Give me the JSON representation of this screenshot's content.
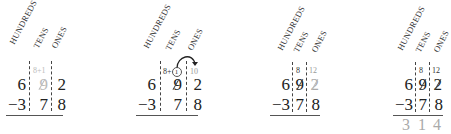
{
  "column_headers": [
    "HUNDREDS",
    "TENS",
    "ONES"
  ],
  "panels": [
    {
      "step": 1,
      "top_digits": [
        "6",
        "9",
        "2"
      ],
      "bottom_digits": [
        "−3",
        "7",
        "8"
      ],
      "tens_annotation": "8+1",
      "ones_annotation": "",
      "tens_top_style": "light",
      "answer": []
    },
    {
      "step": 2,
      "top_digits": [
        "6",
        "9",
        "2"
      ],
      "bottom_digits": [
        "−3",
        "7",
        "8"
      ],
      "tens_annotation_prefix": "8+",
      "tens_annotation_circled": "1",
      "ones_annotation": "10",
      "arrow": "borrow-arrow",
      "answer": []
    },
    {
      "step": 3,
      "top_digits": [
        "6",
        "9",
        "2"
      ],
      "bottom_digits": [
        "−3",
        "7",
        "8"
      ],
      "tens_annotation": "8",
      "ones_annotation": "12",
      "answer": []
    },
    {
      "step": 4,
      "top_digits": [
        "6",
        "9",
        "2"
      ],
      "bottom_digits": [
        "−3",
        "7",
        "8"
      ],
      "tens_annotation": "8",
      "ones_annotation": "12",
      "answer": [
        "3",
        "1",
        "4"
      ]
    }
  ]
}
